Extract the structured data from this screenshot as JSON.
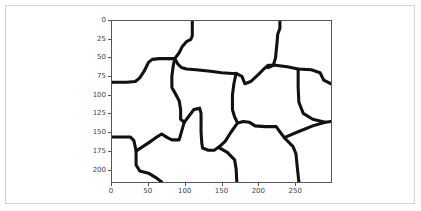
{
  "chart_data": {
    "type": "image",
    "title": "",
    "xlabel": "",
    "ylabel": "",
    "xlim": [
      0,
      300
    ],
    "ylim": [
      218,
      0
    ],
    "xticks": [
      "0",
      "50",
      "100",
      "150",
      "200",
      "250"
    ],
    "yticks": [
      "0",
      "25",
      "50",
      "75",
      "100",
      "125",
      "150",
      "175",
      "200"
    ],
    "grid": false,
    "legend": null,
    "line_color": "#111111",
    "background_color": "#ffffff",
    "paths": [
      {
        "name": "top-left-boundary",
        "points": [
          [
            0,
            83
          ],
          [
            20,
            83
          ],
          [
            32,
            82
          ],
          [
            38,
            77
          ],
          [
            44,
            68
          ],
          [
            50,
            56
          ],
          [
            55,
            52
          ],
          [
            65,
            51
          ],
          [
            78,
            51
          ]
        ]
      },
      {
        "name": "top-center-vertical",
        "points": [
          [
            110,
            0
          ],
          [
            110,
            20
          ],
          [
            108,
            25
          ],
          [
            102,
            28
          ],
          [
            96,
            35
          ],
          [
            92,
            43
          ],
          [
            86,
            51
          ],
          [
            78,
            51
          ]
        ]
      },
      {
        "name": "upper-middle-horizontal",
        "points": [
          [
            86,
            51
          ],
          [
            90,
            58
          ],
          [
            95,
            63
          ],
          [
            102,
            65
          ],
          [
            115,
            66
          ],
          [
            135,
            68
          ],
          [
            150,
            70
          ],
          [
            165,
            71
          ],
          [
            170,
            71
          ]
        ]
      },
      {
        "name": "left-middle-vertical",
        "points": [
          [
            86,
            51
          ],
          [
            84,
            60
          ],
          [
            82,
            75
          ],
          [
            82,
            90
          ],
          [
            86,
            97
          ],
          [
            92,
            108
          ],
          [
            94,
            120
          ],
          [
            94,
            133
          ],
          [
            99,
            137
          ]
        ]
      },
      {
        "name": "center-inner-loop",
        "points": [
          [
            99,
            137
          ],
          [
            106,
            128
          ],
          [
            112,
            120
          ],
          [
            120,
            118
          ],
          [
            122,
            125
          ],
          [
            122,
            150
          ],
          [
            123,
            165
          ],
          [
            124,
            172
          ],
          [
            132,
            175
          ],
          [
            140,
            175
          ],
          [
            146,
            171
          ]
        ]
      },
      {
        "name": "left-lower-horizontal",
        "points": [
          [
            0,
            157
          ],
          [
            25,
            157
          ],
          [
            30,
            162
          ],
          [
            33,
            176
          ],
          [
            50,
            165
          ],
          [
            60,
            158
          ],
          [
            68,
            153
          ],
          [
            76,
            158
          ],
          [
            82,
            161
          ],
          [
            92,
            161
          ],
          [
            99,
            137
          ]
        ]
      },
      {
        "name": "bottom-left-curve",
        "points": [
          [
            33,
            176
          ],
          [
            33,
            195
          ],
          [
            38,
            203
          ],
          [
            50,
            206
          ],
          [
            60,
            212
          ],
          [
            68,
            218
          ]
        ]
      },
      {
        "name": "center-right-vertical",
        "points": [
          [
            170,
            71
          ],
          [
            167,
            85
          ],
          [
            165,
            100
          ],
          [
            165,
            120
          ],
          [
            168,
            130
          ],
          [
            172,
            138
          ]
        ]
      },
      {
        "name": "center-bottom-diagonal",
        "points": [
          [
            146,
            171
          ],
          [
            155,
            163
          ],
          [
            162,
            152
          ],
          [
            172,
            138
          ]
        ]
      },
      {
        "name": "center-bottom-down",
        "points": [
          [
            146,
            171
          ],
          [
            158,
            178
          ],
          [
            168,
            188
          ],
          [
            170,
            200
          ],
          [
            171,
            218
          ]
        ]
      },
      {
        "name": "mid-right-horizontal",
        "points": [
          [
            172,
            138
          ],
          [
            180,
            136
          ],
          [
            188,
            137
          ],
          [
            196,
            142
          ],
          [
            210,
            143
          ],
          [
            225,
            143
          ],
          [
            230,
            150
          ],
          [
            236,
            158
          ],
          [
            248,
            170
          ],
          [
            252,
            180
          ],
          [
            254,
            200
          ],
          [
            256,
            218
          ]
        ]
      },
      {
        "name": "right-diagonal-up",
        "points": [
          [
            236,
            158
          ],
          [
            255,
            150
          ],
          [
            275,
            142
          ],
          [
            292,
            137
          ],
          [
            300,
            136
          ]
        ]
      },
      {
        "name": "top-right-vertical",
        "points": [
          [
            230,
            0
          ],
          [
            230,
            10
          ],
          [
            227,
            18
          ],
          [
            226,
            30
          ],
          [
            224,
            50
          ],
          [
            221,
            60
          ],
          [
            214,
            63
          ]
        ]
      },
      {
        "name": "upper-right-horizontal",
        "points": [
          [
            170,
            71
          ],
          [
            178,
            75
          ],
          [
            182,
            85
          ],
          [
            190,
            82
          ],
          [
            200,
            73
          ],
          [
            208,
            65
          ],
          [
            214,
            60
          ],
          [
            224,
            60
          ],
          [
            240,
            62
          ],
          [
            255,
            65
          ],
          [
            273,
            66
          ],
          [
            285,
            70
          ],
          [
            290,
            80
          ],
          [
            300,
            85
          ]
        ]
      },
      {
        "name": "right-inner-vertical",
        "points": [
          [
            255,
            65
          ],
          [
            255,
            90
          ],
          [
            256,
            110
          ],
          [
            262,
            125
          ],
          [
            275,
            133
          ],
          [
            292,
            137
          ]
        ]
      },
      {
        "name": "left-boundary-upper",
        "points": [
          [
            0,
            83
          ],
          [
            0,
            83
          ]
        ]
      }
    ]
  },
  "axes": {
    "yticks": [
      {
        "label": "0",
        "value": 0
      },
      {
        "label": "25",
        "value": 25
      },
      {
        "label": "50",
        "value": 50
      },
      {
        "label": "75",
        "value": 75
      },
      {
        "label": "100",
        "value": 100
      },
      {
        "label": "125",
        "value": 125
      },
      {
        "label": "150",
        "value": 150
      },
      {
        "label": "175",
        "value": 175
      },
      {
        "label": "200",
        "value": 200
      }
    ],
    "xticks": [
      {
        "label": "0",
        "value": 0
      },
      {
        "label": "50",
        "value": 50
      },
      {
        "label": "100",
        "value": 100
      },
      {
        "label": "150",
        "value": 150
      },
      {
        "label": "200",
        "value": 200
      },
      {
        "label": "250",
        "value": 250
      }
    ]
  }
}
